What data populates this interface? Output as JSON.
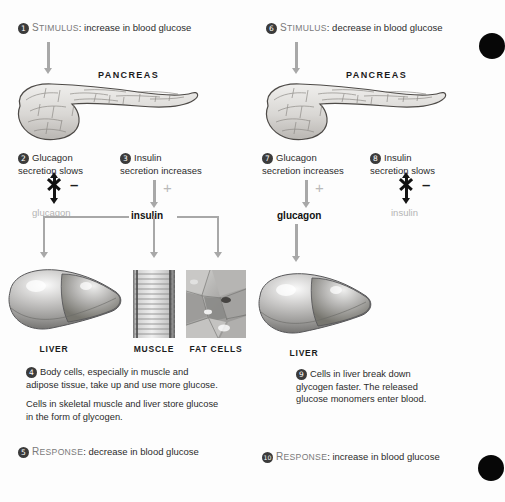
{
  "figure": {
    "title_hidden": "Hormonal regulation of blood glucose",
    "background": "#fdfdfd",
    "accent_gray": "#a8a8a8",
    "ink": "#231f20"
  },
  "left": {
    "step1": {
      "number": "1",
      "keyword_first": "S",
      "keyword_rest": "TIMULUS",
      "separator": ": ",
      "text": "increase in blood glucose"
    },
    "pancreas_label": "PANCREAS",
    "step2": {
      "number": "2",
      "line1": "Glucagon",
      "line2": "secretion slows",
      "sign": "–",
      "hormone": "glucagon",
      "hormone_state": "suppressed"
    },
    "step3": {
      "number": "3",
      "line1": "Insulin",
      "line2": "secretion increases",
      "sign": "+",
      "hormone": "insulin",
      "hormone_state": "active"
    },
    "targets": [
      {
        "label": "LIVER",
        "icon": "liver-icon"
      },
      {
        "label": "MUSCLE",
        "icon": "muscle-icon"
      },
      {
        "label": "FAT CELLS",
        "icon": "fat-cells-icon"
      }
    ],
    "step4": {
      "number": "4",
      "paragraph1": "Body cells, especially in muscle and adipose tissue, take up and use more glucose.",
      "paragraph2": "Cells in skeletal muscle and liver store glucose in the form of glycogen."
    },
    "step5": {
      "number": "5",
      "keyword_first": "R",
      "keyword_rest": "ESPONSE",
      "separator": ": ",
      "text": "decrease in blood glucose"
    }
  },
  "right": {
    "step6": {
      "number": "6",
      "keyword_first": "S",
      "keyword_rest": "TIMULUS",
      "separator": ": ",
      "text": "decrease in blood glucose"
    },
    "pancreas_label": "PANCREAS",
    "step7": {
      "number": "7",
      "line1": "Glucagon",
      "line2": "secretion increases",
      "sign": "+",
      "hormone": "glucagon",
      "hormone_state": "active"
    },
    "step8": {
      "number": "8",
      "line1": "Insulin",
      "line2": "secretion slows",
      "sign": "–",
      "hormone": "insulin",
      "hormone_state": "suppressed"
    },
    "targets": [
      {
        "label": "LIVER",
        "icon": "liver-icon"
      }
    ],
    "step9": {
      "number": "9",
      "paragraph1": "Cells in liver break down glycogen faster. The released glucose monomers enter blood."
    },
    "step10": {
      "number": "10",
      "keyword_first": "R",
      "keyword_rest": "ESPONSE",
      "separator": ": ",
      "text": "increase in blood glucose"
    }
  }
}
